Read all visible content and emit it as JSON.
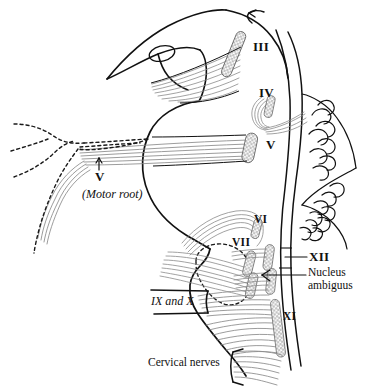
{
  "figure": {
    "kind": "anatomical-line-drawing",
    "background_color": "#ffffff",
    "ink_color": "#111111",
    "fiber_color": "#8a8a8a",
    "nucleus_stipple_color": "#6e6e6e",
    "dashed_outline_color": "#1a1a1a"
  },
  "labels": {
    "nerve_iii": "III",
    "nerve_iv": "IV",
    "nerve_v_nucleus": "V",
    "nerve_v_root": "V",
    "nerve_v_root_note": "(Motor root)",
    "nerve_vi": "VI",
    "nerve_vii": "VII",
    "nerve_ix_and_x": "IX and X",
    "nerve_xi": "XI",
    "nerve_xii": "XII",
    "nucleus_ambiguus_line1": "Nucleus",
    "nucleus_ambiguus_line2": "ambiguus",
    "cervical_nerves": "Cervical nerves"
  },
  "structures": {
    "brainstem": "brainstem-outline",
    "cerebellum": "cerebellum-folia",
    "trigeminal_ganglion": "dashed-trigeminal-ganglion",
    "facial_genu": "dashed-facial-genu-loop",
    "midbrain": "midbrain-cerebral-peduncle",
    "arrow": "aqueduct-arrow"
  }
}
